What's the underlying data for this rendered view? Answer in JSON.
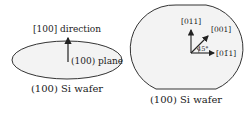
{
  "left_figure": {
    "direction_label": "[100] direction",
    "plane_label": "(100) plane",
    "caption": "(100) Si wafer"
  },
  "right_figure": {
    "axis_up_label": "[011]",
    "axis_diag_label": "[001]",
    "axis_right_label": "[01̄1]",
    "angle_label": "45°",
    "caption": "(100) Si wafer"
  },
  "colors": {
    "wafer_fill": "#f2f2f2",
    "stroke": "#333333"
  }
}
